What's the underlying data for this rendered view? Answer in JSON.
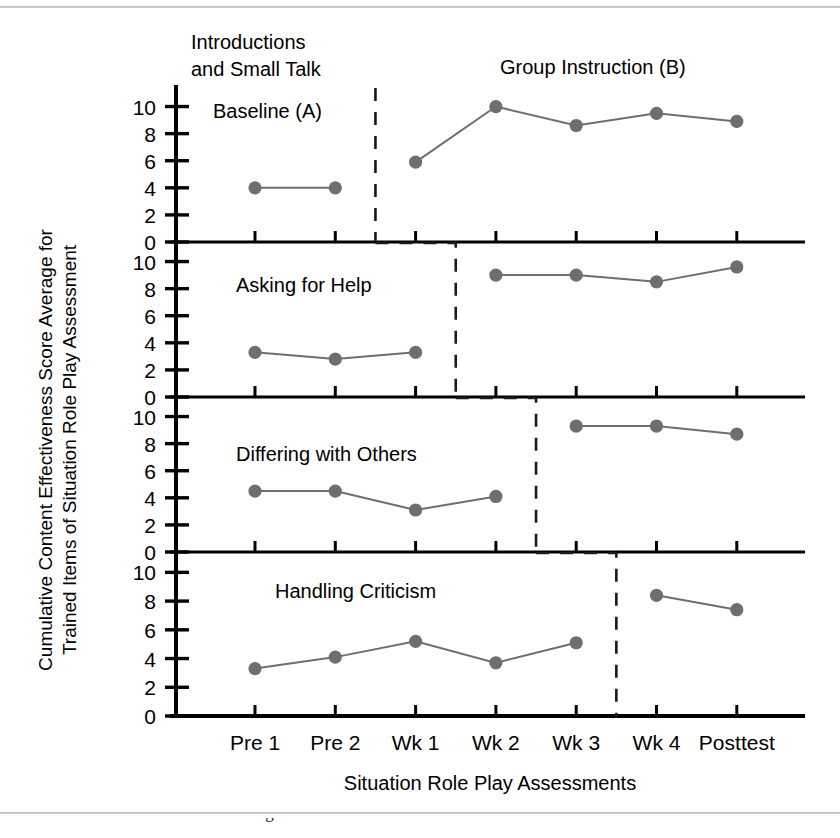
{
  "figure": {
    "phase_labels": {
      "baseline_top": "Introductions",
      "baseline_top_line2": "and Small Talk",
      "baseline_inline": "Baseline (A)",
      "intervention": "Group Instruction (B)"
    },
    "x_axis_title": "Situation Role Play Assessments",
    "y_axis_title_line1": "Cumulative Content Effectiveness Score Average for",
    "y_axis_title_line2": "Trained Items of Situation Role Play Assessment",
    "caption_partial": "1.1 Structure with behavior diagram ... the influence of instruction ..."
  },
  "colors": {
    "marker": "#6e6e6e",
    "line": "#6e6e6e",
    "axis": "#000000",
    "phase_line": "#1a1a1a",
    "background": "#ffffff"
  },
  "chart_data": {
    "type": "line",
    "title": "",
    "subtitle": "",
    "xlabel": "Situation Role Play Assessments",
    "ylabel": "Cumulative Content Effectiveness Score Average for Trained Items of Situation Role Play Assessment",
    "x": [
      "Pre 1",
      "Pre 2",
      "Wk 1",
      "Wk 2",
      "Wk 3",
      "Wk 4",
      "Posttest"
    ],
    "ylim": [
      0,
      11
    ],
    "yticks": [
      0,
      2,
      4,
      6,
      8,
      10
    ],
    "grid": false,
    "legend": "none",
    "annotations": [
      "Introductions and Small Talk",
      "Baseline (A)",
      "Group Instruction (B)",
      "Asking for Help",
      "Differing with Others",
      "Handling Criticism"
    ],
    "panels": [
      {
        "name": "Introductions and Small Talk",
        "baseline_phase": "A",
        "intervention_phase": "B",
        "phase_change_after": "Pre 2",
        "baseline": {
          "x": [
            "Pre 1",
            "Pre 2"
          ],
          "values": [
            4.0,
            4.0
          ]
        },
        "intervention": {
          "x": [
            "Wk 1",
            "Wk 2",
            "Wk 3",
            "Wk 4",
            "Posttest"
          ],
          "values": [
            5.9,
            10.0,
            8.6,
            9.5,
            8.9
          ]
        }
      },
      {
        "name": "Asking for Help",
        "baseline_phase": "A",
        "intervention_phase": "B",
        "phase_change_after": "Wk 1",
        "baseline": {
          "x": [
            "Pre 1",
            "Pre 2",
            "Wk 1"
          ],
          "values": [
            3.3,
            2.8,
            3.3
          ]
        },
        "intervention": {
          "x": [
            "Wk 2",
            "Wk 3",
            "Wk 4",
            "Posttest"
          ],
          "values": [
            9.0,
            9.0,
            8.5,
            9.6
          ]
        }
      },
      {
        "name": "Differing with Others",
        "baseline_phase": "A",
        "intervention_phase": "B",
        "phase_change_after": "Wk 2",
        "baseline": {
          "x": [
            "Pre 1",
            "Pre 2",
            "Wk 1",
            "Wk 2"
          ],
          "values": [
            4.5,
            4.5,
            3.1,
            4.1
          ]
        },
        "intervention": {
          "x": [
            "Wk 3",
            "Wk 4",
            "Posttest"
          ],
          "values": [
            9.3,
            9.3,
            8.7
          ]
        }
      },
      {
        "name": "Handling Criticism",
        "baseline_phase": "A",
        "intervention_phase": "B",
        "phase_change_after": "Wk 3",
        "baseline": {
          "x": [
            "Pre 1",
            "Pre 2",
            "Wk 1",
            "Wk 2",
            "Wk 3"
          ],
          "values": [
            3.3,
            4.1,
            5.2,
            3.7,
            5.1
          ]
        },
        "intervention": {
          "x": [
            "Wk 4",
            "Posttest"
          ],
          "values": [
            8.4,
            7.4
          ]
        }
      }
    ]
  }
}
